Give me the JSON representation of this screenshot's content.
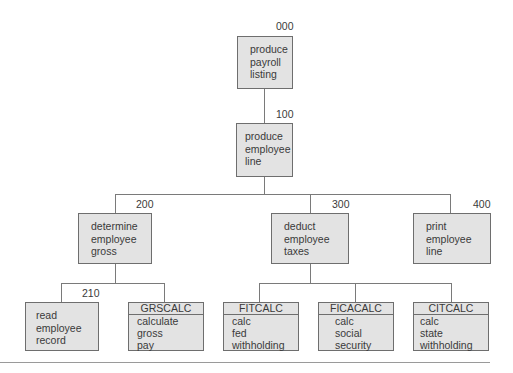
{
  "diagram": {
    "type": "structure-chart",
    "nodes": [
      {
        "id": "000",
        "label": "produce\npayroll\nlisting"
      },
      {
        "id": "100",
        "label": "produce\nemployee\nline"
      },
      {
        "id": "200",
        "label": "determine\nemployee\ngross"
      },
      {
        "id": "300",
        "label": "deduct\nemployee\ntaxes"
      },
      {
        "id": "400",
        "label": "print\nemployee\nline"
      },
      {
        "id": "210",
        "label": "read\nemployee\nrecord"
      },
      {
        "module": "GRSCALC",
        "label": "calculate\ngross\npay"
      },
      {
        "module": "FITCALC",
        "label": "calc\nfed\nwithholding"
      },
      {
        "module": "FICACALC",
        "label": "calc\nsocial\nsecurity"
      },
      {
        "module": "CITCALC",
        "label": "calc\nstate\nwithholding"
      }
    ],
    "edges": [
      [
        "000",
        "100"
      ],
      [
        "100",
        "200"
      ],
      [
        "100",
        "300"
      ],
      [
        "100",
        "400"
      ],
      [
        "200",
        "210"
      ],
      [
        "200",
        "GRSCALC"
      ],
      [
        "300",
        "FITCALC"
      ],
      [
        "300",
        "FICACALC"
      ],
      [
        "300",
        "CITCALC"
      ]
    ]
  }
}
